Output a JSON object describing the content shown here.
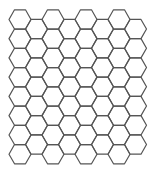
{
  "diagram": {
    "type": "hexagonal-grid",
    "orientation": "flat-top",
    "columns": 8,
    "rows_even_columns": 8,
    "rows_odd_columns": 7,
    "odd_column_offset": "down-half",
    "geometry": {
      "side": 11,
      "hex_height": 19.25,
      "first_center_x": 20,
      "first_top_y": 9.8
    },
    "colors": {
      "background": "#ffffff",
      "stroke": "#555555"
    },
    "stroke_width": 1.2
  }
}
